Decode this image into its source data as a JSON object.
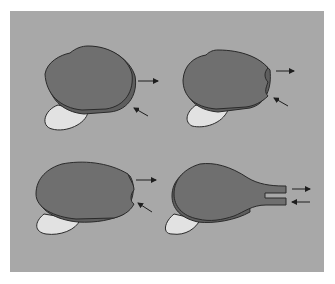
{
  "figure": {
    "type": "schematic diagram",
    "panels": [
      {
        "id": "top-left",
        "description": "rounded body with tongue, two arrows (outward and inward) at right edge"
      },
      {
        "id": "top-right",
        "description": "body with small indentations at right edge, two arrows"
      },
      {
        "id": "bottom-left",
        "description": "elongated body with two bulges at right edge, two arrows"
      },
      {
        "id": "bottom-right",
        "description": "body extended into two tubes at right, arrows out of upper tube and into lower tube"
      }
    ],
    "colors": {
      "background": "#a8a8a8",
      "body": "#6f6f6f",
      "body_rim": "#5e5e5e",
      "tongue": "#e2e2e2",
      "outline": "#2a2a2a"
    }
  }
}
